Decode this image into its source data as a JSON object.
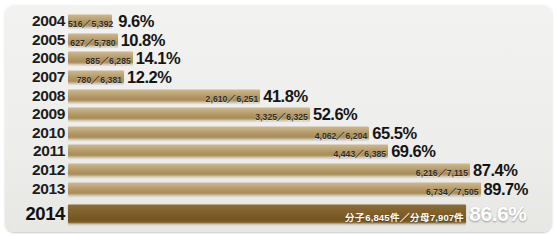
{
  "panel": {
    "background_color": "#eeeeec",
    "bar_color": "#b09663",
    "highlight_bar_color": "#7a5b27"
  },
  "chart_data": {
    "type": "bar",
    "orientation": "horizontal",
    "title": "",
    "xlabel": "",
    "ylabel": "",
    "xlim": [
      0,
      100
    ],
    "grid": false,
    "legend": null,
    "categories": [
      "2004",
      "2005",
      "2006",
      "2007",
      "2008",
      "2009",
      "2010",
      "2011",
      "2012",
      "2013",
      "2014"
    ],
    "values": [
      9.6,
      10.8,
      14.1,
      12.2,
      41.8,
      52.6,
      65.5,
      69.6,
      87.4,
      89.7,
      86.6
    ],
    "value_labels": [
      "9.6%",
      "10.8%",
      "14.1%",
      "12.2%",
      "41.8%",
      "52.6%",
      "65.5%",
      "69.6%",
      "87.4%",
      "89.7%",
      "86.6%"
    ],
    "numerators": [
      516,
      627,
      885,
      780,
      2610,
      3325,
      4062,
      4443,
      6216,
      6734,
      6845
    ],
    "denominators": [
      5392,
      5780,
      6285,
      6381,
      6251,
      6325,
      6204,
      6385,
      7115,
      7505,
      7907
    ],
    "fraction_labels": [
      "516／5,392",
      "627／5,780",
      "885／6,285",
      "780／6,381",
      "2,610／6,251",
      "3,325／6,325",
      "4,062／6,204",
      "4,443／6,385",
      "6,216／7,115",
      "6,734／7,505",
      "分子6,845件／分母7,907件"
    ],
    "highlight_index": 10
  },
  "rows": [
    {
      "year": "2004",
      "fraction": "516／5,392",
      "percent": "9.6%",
      "value": 9.6,
      "emphasis": false
    },
    {
      "year": "2005",
      "fraction": "627／5,780",
      "percent": "10.8%",
      "value": 10.8,
      "emphasis": false
    },
    {
      "year": "2006",
      "fraction": "885／6,285",
      "percent": "14.1%",
      "value": 14.1,
      "emphasis": false
    },
    {
      "year": "2007",
      "fraction": "780／6,381",
      "percent": "12.2%",
      "value": 12.2,
      "emphasis": false
    },
    {
      "year": "2008",
      "fraction": "2,610／6,251",
      "percent": "41.8%",
      "value": 41.8,
      "emphasis": false
    },
    {
      "year": "2009",
      "fraction": "3,325／6,325",
      "percent": "52.6%",
      "value": 52.6,
      "emphasis": false
    },
    {
      "year": "2010",
      "fraction": "4,062／6,204",
      "percent": "65.5%",
      "value": 65.5,
      "emphasis": false
    },
    {
      "year": "2011",
      "fraction": "4,443／6,385",
      "percent": "69.6%",
      "value": 69.6,
      "emphasis": false
    },
    {
      "year": "2012",
      "fraction": "6,216／7,115",
      "percent": "87.4%",
      "value": 87.4,
      "emphasis": false
    },
    {
      "year": "2013",
      "fraction": "6,734／7,505",
      "percent": "89.7%",
      "value": 89.7,
      "emphasis": false
    },
    {
      "year": "2014",
      "fraction": "分子6,845件／分母7,907件",
      "percent": "86.6%",
      "value": 86.6,
      "emphasis": true
    }
  ]
}
